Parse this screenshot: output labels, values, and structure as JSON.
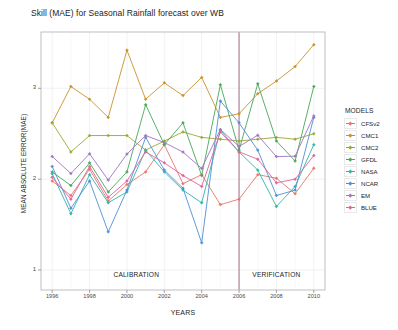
{
  "chart_data": {
    "type": "line",
    "title": "Skill (MAE) for Seasonal Rainfall forecast over WB",
    "xlabel": "YEARS",
    "ylabel": "MEAN ABSOLUTE ERROR(MAE)",
    "xlim": [
      1995.4,
      2010.6
    ],
    "ylim": [
      0.78,
      3.62
    ],
    "x": [
      1996,
      1997,
      1998,
      1999,
      2000,
      2001,
      2002,
      2003,
      2004,
      2005,
      2006,
      2007,
      2008,
      2009,
      2010
    ],
    "xticks": [
      1996,
      1998,
      2000,
      2002,
      2004,
      2006,
      2008,
      2010
    ],
    "xticklabels": [
      "1996",
      "1998",
      "2000",
      "2002",
      "2004",
      "2006",
      "2008",
      "2010"
    ],
    "yticks": [
      1,
      2,
      3
    ],
    "yticklabels": [
      "1",
      "2",
      "3"
    ],
    "grid": true,
    "legend_position": "right",
    "legend_title": "MODELS",
    "annotations": [
      {
        "text": "CALIBRATION",
        "x": 2000.5,
        "y": 0.93
      },
      {
        "text": "VERIFICATION",
        "x": 2008.0,
        "y": 0.93
      }
    ],
    "vertical_divider": {
      "x": 2006,
      "color": "#9d5f7a"
    },
    "series": [
      {
        "name": "CFSv2",
        "color": "#e8756b",
        "values": [
          1.98,
          1.82,
          2.11,
          1.76,
          1.94,
          2.08,
          2.38,
          1.95,
          2.05,
          1.72,
          1.78,
          2.05,
          2.01,
          1.84,
          2.12
        ]
      },
      {
        "name": "CMC1",
        "color": "#c8922b",
        "values": [
          2.62,
          3.02,
          2.88,
          2.68,
          3.42,
          2.88,
          3.06,
          2.92,
          3.12,
          2.68,
          2.72,
          2.94,
          3.08,
          3.24,
          3.48
        ]
      },
      {
        "name": "CMC2",
        "color": "#9aa832",
        "values": [
          2.62,
          2.3,
          2.48,
          2.48,
          2.48,
          2.32,
          2.42,
          2.52,
          2.46,
          2.44,
          2.42,
          2.44,
          2.46,
          2.44,
          2.5
        ]
      },
      {
        "name": "GFDL",
        "color": "#46a858",
        "values": [
          2.08,
          1.93,
          2.18,
          1.86,
          2.08,
          2.82,
          2.38,
          2.62,
          2.04,
          3.04,
          2.32,
          3.05,
          2.42,
          2.2,
          3.02
        ]
      },
      {
        "name": "NASA",
        "color": "#2fb5a8",
        "values": [
          2.06,
          1.62,
          2.05,
          1.74,
          1.86,
          2.32,
          2.08,
          1.88,
          1.74,
          2.54,
          2.3,
          2.1,
          1.7,
          1.92,
          2.38
        ]
      },
      {
        "name": "NCAR",
        "color": "#4f8ed6",
        "values": [
          2.14,
          1.68,
          1.98,
          1.42,
          1.88,
          2.46,
          2.1,
          1.9,
          1.3,
          2.86,
          2.62,
          2.32,
          1.82,
          1.88,
          2.68
        ]
      },
      {
        "name": "EM",
        "color": "#a073c4"
      },
      {
        "name": "BLUE",
        "color": "#e0629c",
        "values": [
          2.02,
          1.78,
          2.14,
          1.8,
          1.98,
          2.3,
          2.18,
          2.04,
          1.92,
          2.52,
          2.3,
          2.22,
          1.96,
          2.0,
          2.26
        ]
      }
    ]
  },
  "legend": {
    "title": "MODELS",
    "items": [
      {
        "label": "CFSv2"
      },
      {
        "label": "CMC1"
      },
      {
        "label": "CMC2"
      },
      {
        "label": "GFDL"
      },
      {
        "label": "NASA"
      },
      {
        "label": "NCAR"
      },
      {
        "label": "EM"
      },
      {
        "label": "BLUE"
      }
    ]
  },
  "colors": {
    "panel_border": "#b8b8b8",
    "grid": "#ededed",
    "text": "#1c1c1c",
    "tick_text": "#4a4a4a",
    "background": "#ffffff"
  }
}
